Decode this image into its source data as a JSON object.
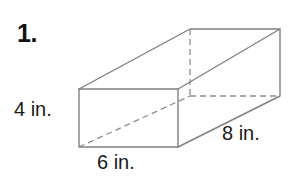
{
  "problem": {
    "number_label": "1.",
    "shape_name": "rectangular-prism"
  },
  "dimensions": {
    "height_label": "4 in.",
    "width_label": "6 in.",
    "depth_label": "8 in.",
    "height_value": 4,
    "width_value": 6,
    "depth_value": 8,
    "unit": "in."
  },
  "style": {
    "solid_edge_color": "#808080",
    "hidden_edge_color": "#8c8c8c",
    "text_color": "#1a1a1a",
    "background_color": "#ffffff",
    "stroke_width": 1.4,
    "hidden_dash_pattern": "6,4"
  },
  "geometry": {
    "front_face": {
      "top_left": [
        79,
        89
      ],
      "top_right": [
        178,
        89
      ],
      "bottom_right": [
        178,
        147
      ],
      "bottom_left": [
        79,
        147
      ]
    },
    "back_face": {
      "top_left": [
        190,
        29
      ],
      "top_right": [
        280,
        29
      ],
      "bottom_right": [
        280,
        96
      ],
      "bottom_left": [
        190,
        96
      ]
    }
  }
}
